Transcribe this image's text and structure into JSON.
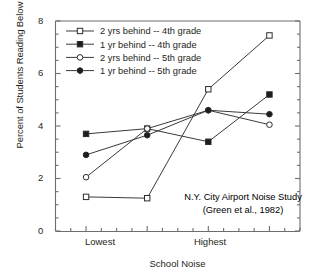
{
  "chart_data": {
    "type": "line",
    "title": "",
    "xlabel": "School Noise",
    "ylabel": "Percent of Students Reading Below Grade Level",
    "categories": [
      "Lowest",
      "",
      "Highest",
      ""
    ],
    "x": [
      1,
      2,
      3,
      4
    ],
    "xtick_labels": [
      "Lowest",
      "Highest"
    ],
    "ytick_labels": [
      "0",
      "2",
      "4",
      "6",
      "8"
    ],
    "yticks": [
      0,
      2,
      4,
      6,
      8
    ],
    "ylim": [
      0,
      8
    ],
    "xlim": [
      0.5,
      4.5
    ],
    "grid": false,
    "legend_position": "top-left",
    "minor_ticks": true,
    "series": [
      {
        "name": "2 yrs behind -- 4th grade",
        "marker": "open-square",
        "values": [
          1.3,
          1.25,
          5.4,
          7.45
        ]
      },
      {
        "name": "1 yr behind -- 4th grade",
        "marker": "filled-square",
        "values": [
          3.7,
          3.9,
          3.4,
          5.2
        ]
      },
      {
        "name": "2 yrs behind -- 5th grade",
        "marker": "open-circle",
        "values": [
          2.05,
          3.9,
          4.6,
          4.05
        ]
      },
      {
        "name": "1 yr behind -- 5th grade",
        "marker": "filled-circle",
        "values": [
          2.9,
          3.65,
          4.6,
          4.45
        ]
      }
    ],
    "annotations": [
      "N.Y. City Airport Noise Study",
      "(Green et al., 1982)"
    ],
    "colors": {
      "line": "#3a3a3a",
      "axis": "#6d6d6d",
      "text": "#231f20",
      "background": "#ffffff"
    }
  }
}
